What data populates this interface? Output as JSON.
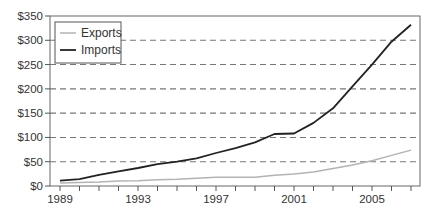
{
  "chart_data": {
    "type": "line",
    "title": "",
    "xlabel": "",
    "ylabel": "",
    "x": [
      1989,
      1990,
      1991,
      1992,
      1993,
      1994,
      1995,
      1996,
      1997,
      1998,
      1999,
      2000,
      2001,
      2002,
      2003,
      2004,
      2005,
      2006,
      2007
    ],
    "series": [
      {
        "name": "Exports",
        "color": "#b3b3b3",
        "values": [
          6,
          7,
          8,
          10,
          11,
          13,
          14,
          16,
          18,
          18,
          18,
          22,
          25,
          29,
          36,
          43,
          52,
          63,
          74
        ]
      },
      {
        "name": "Imports",
        "color": "#222222",
        "values": [
          11,
          14,
          23,
          30,
          37,
          45,
          50,
          57,
          68,
          78,
          90,
          107,
          108,
          130,
          160,
          205,
          250,
          297,
          332
        ]
      }
    ],
    "ylim": [
      0,
      350
    ],
    "yticks": [
      0,
      50,
      100,
      150,
      200,
      250,
      300,
      350
    ],
    "ytick_labels": [
      "$0",
      "$50",
      "$100",
      "$150",
      "$200",
      "$250",
      "$300",
      "$350"
    ],
    "xtick_labels": [
      {
        "year": 1989,
        "label": "1989"
      },
      {
        "year": 1993,
        "label": "1993"
      },
      {
        "year": 1997,
        "label": "1997"
      },
      {
        "year": 2001,
        "label": "2001"
      },
      {
        "year": 2005,
        "label": "2005"
      }
    ],
    "grid": "horizontal dashed",
    "legend_position": "upper left"
  },
  "legend": {
    "items": [
      {
        "label": "Exports",
        "color": "#b3b3b3"
      },
      {
        "label": "Imports",
        "color": "#222222"
      }
    ]
  }
}
